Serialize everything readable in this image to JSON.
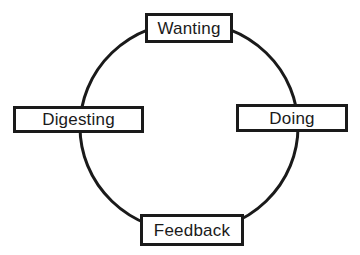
{
  "diagram": {
    "type": "cycle",
    "ring": {
      "cx": 189,
      "cy": 127,
      "rx": 109,
      "ry": 105,
      "stroke_color": "#1a1a1a",
      "stroke_width": 3
    },
    "nodes": [
      {
        "id": "wanting",
        "label": "Wanting",
        "position": "top"
      },
      {
        "id": "doing",
        "label": "Doing",
        "position": "right"
      },
      {
        "id": "feedback",
        "label": "Feedback",
        "position": "bottom"
      },
      {
        "id": "digesting",
        "label": "Digesting",
        "position": "left"
      }
    ],
    "colors": {
      "background": "#ffffff",
      "line": "#1a1a1a",
      "text": "#1a1a1a",
      "box_fill": "#ffffff"
    }
  }
}
